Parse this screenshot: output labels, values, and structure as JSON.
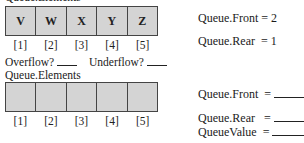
{
  "top": {
    "label": "Queue.Elements",
    "elements": [
      "V",
      "W",
      "X",
      "Y",
      "Z"
    ],
    "indices": [
      "[1]",
      "[2]",
      "[3]",
      "[4]",
      "[5]"
    ],
    "front_label": "Queue.Front = 2",
    "rear_label": "Queue.Rear  = 1"
  },
  "questions": {
    "overflow_label": "Overflow?",
    "underflow_label": "Underflow?"
  },
  "bottom": {
    "label": "Queue.Elements",
    "elements": [
      "",
      "",
      "",
      "",
      ""
    ],
    "indices": [
      "[1]",
      "[2]",
      "[3]",
      "[4]",
      "[5]"
    ],
    "front_label": "Queue.Front  =",
    "rear_label": "Queue.Rear   =",
    "value_label": "QueueValue  ="
  },
  "colors": {
    "cell_fill": "#d4d4d4",
    "border": "#444444"
  }
}
